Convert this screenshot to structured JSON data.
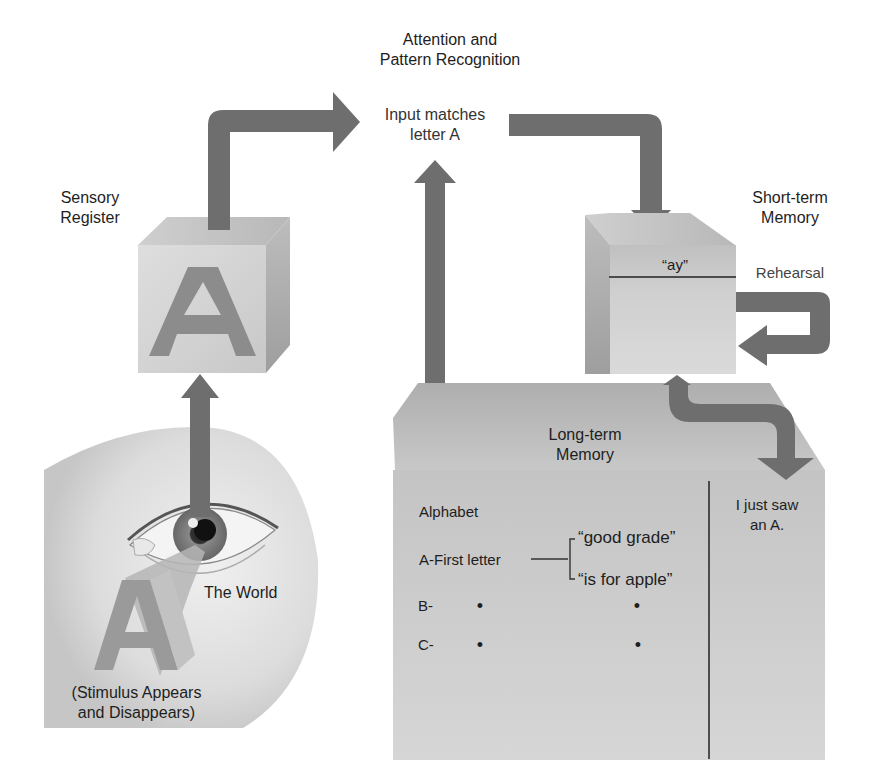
{
  "stages": {
    "attention": {
      "label_line1": "Attention and",
      "label_line2": "Pattern Recognition",
      "text_line1": "Input matches",
      "text_line2": "letter A"
    },
    "sensory_register": {
      "label_line1": "Sensory",
      "label_line2": "Register",
      "letter": "A"
    },
    "short_term_memory": {
      "label_line1": "Short-term",
      "label_line2": "Memory",
      "content": "“ay”",
      "rehearsal_label": "Rehearsal"
    },
    "long_term_memory": {
      "label_line1": "Long-term",
      "label_line2": "Memory",
      "alphabet_heading": "Alphabet",
      "rows": [
        {
          "key": "A-First letter",
          "associations": [
            "“good grade”",
            "“is for apple”"
          ]
        },
        {
          "key": "B-",
          "associations": [
            "•",
            "•"
          ]
        },
        {
          "key": "C-",
          "associations": [
            "•",
            "•"
          ]
        }
      ],
      "episodic_line1": "I just saw",
      "episodic_line2": "an A."
    },
    "world": {
      "label": "The World",
      "stimulus_line1": "(Stimulus Appears",
      "stimulus_line2": "and Disappears)",
      "letter": "A"
    }
  },
  "colors": {
    "arrow": "#6e6e6e",
    "cube_face": "#d4d4d4",
    "cube_top": "#c6c6c6",
    "cube_side": "#a9a9a9",
    "letter": "#8c8c8c",
    "ltm_top": "#b9b9b9",
    "ltm_front": "#c9c9c9",
    "circle": "#e2e2e2"
  }
}
